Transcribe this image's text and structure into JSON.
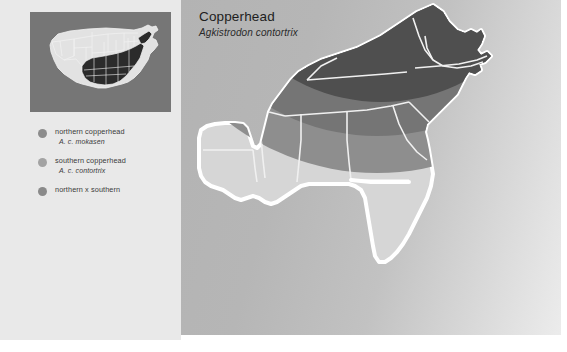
{
  "header": {
    "title": "Copperhead",
    "subtitle": "Agkistrodon contortrix"
  },
  "legend": {
    "items": [
      {
        "label": "northern copperhead",
        "scientific": "A. c. mokasen",
        "color": "#8c8c8c"
      },
      {
        "label": "southern copperhead",
        "scientific": "A. c. contortrix",
        "color": "#a3a3a3"
      },
      {
        "label": "northern x southern",
        "scientific": "",
        "color": "#8a8a8a"
      }
    ]
  },
  "inset_map": {
    "name": "united-states-locator-map",
    "background": "#767676",
    "land_color": "#e2e2e2",
    "highlight_color": "#2b2b2b",
    "border_color": "#f2f2f2"
  },
  "main_map": {
    "name": "southeastern-united-states-range-map",
    "land_color": "#d6d6d6",
    "outline_color": "#ffffff",
    "range_northern_color": "#4f4f4f",
    "range_hybrid_color": "#757575",
    "range_southern_color": "#8e8e8e",
    "state_border_color": "#f0f0f0"
  },
  "colors": {
    "left_panel_background": "#e9e9e9",
    "right_panel_background": "#b8b8b8",
    "page_background": "#ffffff",
    "text": "#3b3b3b"
  }
}
